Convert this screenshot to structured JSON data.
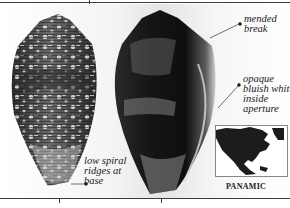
{
  "figure": {
    "shells": [
      {
        "name": "left-shell",
        "description": "white-mottled dark cone shell, dorsal view"
      },
      {
        "name": "right-shell",
        "description": "dark cone shell, apertural view"
      }
    ],
    "annotations": {
      "mended_break": "mended\nbreak",
      "opaque_aperture": "opaque\nbluish white\ninside\naperture",
      "spiral_ridges": "low spiral\nridges at\nbase"
    },
    "map": {
      "caption": "PANAMIC",
      "region": "North and Central America"
    }
  }
}
